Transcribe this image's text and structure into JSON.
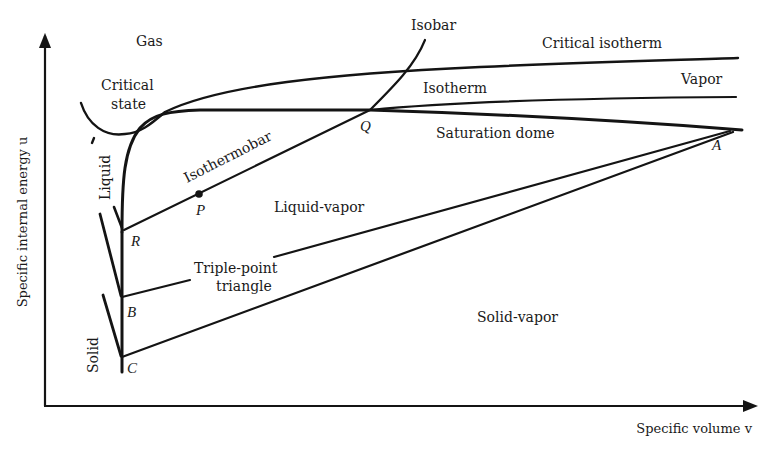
{
  "axes": {
    "y_label": "Specific internal energy u",
    "x_label": "Specific volume v"
  },
  "regions": {
    "gas": "Gas",
    "critical_state_line1": "Critical",
    "critical_state_line2": "state",
    "liquid": "Liquid",
    "solid": "Solid",
    "vapor": "Vapor",
    "liquid_vapor": "Liquid-vapor",
    "solid_vapor": "Solid-vapor",
    "triple_point_line1": "Triple-point",
    "triple_point_line2": "triangle"
  },
  "curves": {
    "isobar": "Isobar",
    "critical_isotherm": "Critical isotherm",
    "isotherm": "Isotherm",
    "saturation_dome": "Saturation dome",
    "isothermobar": "Isothermobar"
  },
  "points": {
    "A": "A",
    "B": "B",
    "C": "C",
    "P": "P",
    "Q": "Q",
    "R": "R"
  },
  "colors": {
    "ink": "#141414",
    "background": "#ffffff"
  }
}
